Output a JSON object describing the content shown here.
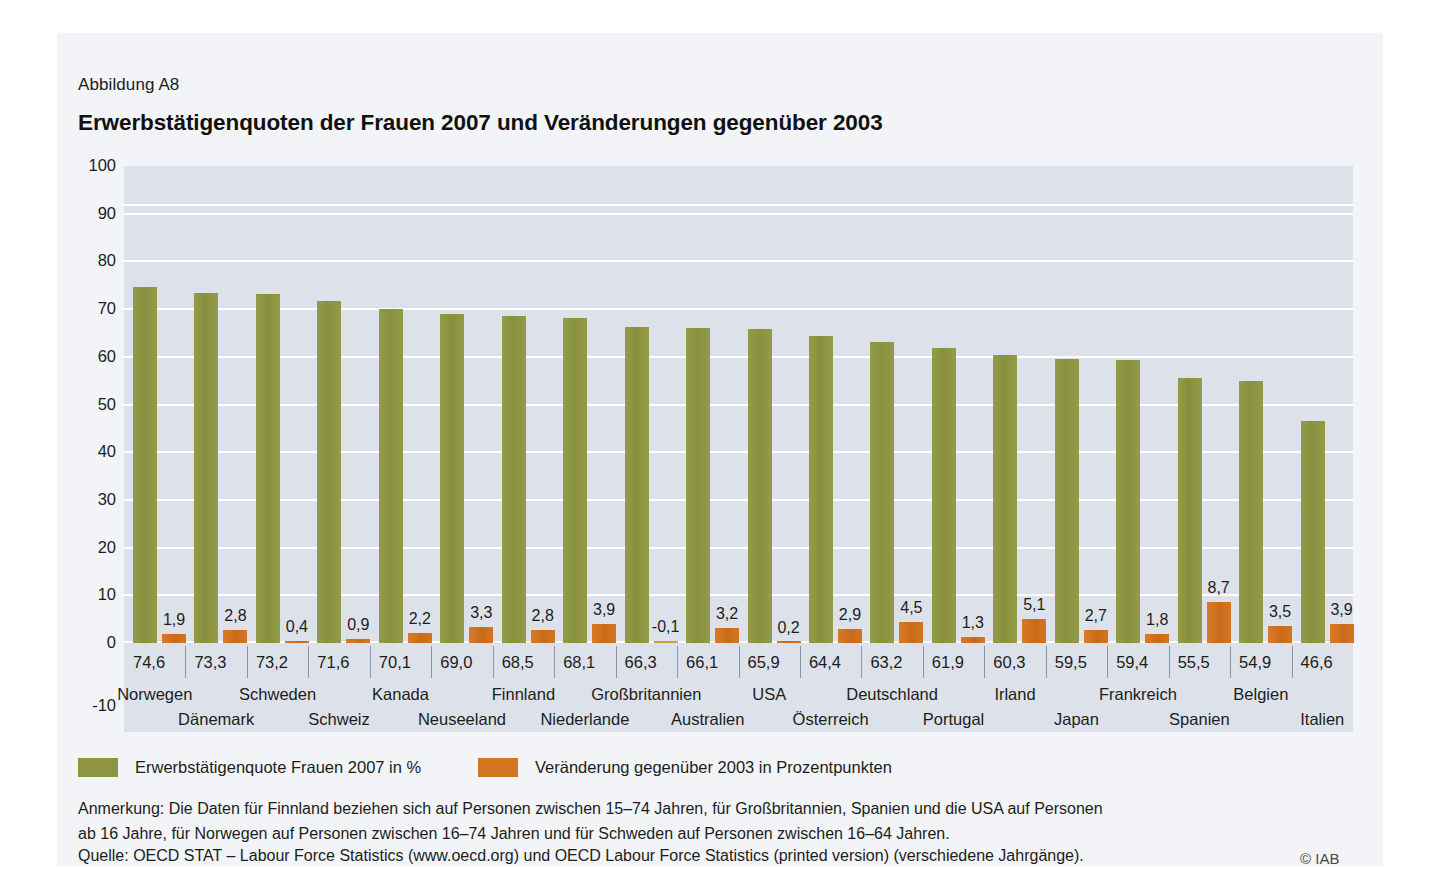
{
  "figure": {
    "number": "Abbildung A8",
    "title": "Erwerbstätigenquoten der Frauen 2007 und Veränderungen gegenüber 2003"
  },
  "legend": {
    "items": [
      {
        "label": "Erwerbstätigenquote Frauen 2007 in %",
        "color": "#8d9541",
        "swatch": "green-swatch"
      },
      {
        "label": "Veränderung gegenüber 2003 in Prozentpunkten",
        "color": "#d4761f",
        "swatch": "orange-swatch"
      }
    ]
  },
  "notes": {
    "line1": "Anmerkung: Die Daten für Finnland beziehen sich auf Personen zwischen 15–74 Jahren, für Großbritannien, Spanien und die USA auf Personen",
    "line2": "ab 16 Jahre, für Norwegen auf Personen zwischen 16–74 Jahren und für Schweden auf Personen zwischen 16–64 Jahren.",
    "source": "Quelle: OECD STAT – Labour Force Statistics (www.oecd.org) und OECD Labour Force Statistics (printed version) (verschiedene Jahrgänge).",
    "copyright": "© IAB"
  },
  "chart_data": {
    "type": "bar",
    "title": "Erwerbstätigenquoten der Frauen 2007 und Veränderungen gegenüber 2003",
    "xlabel": "",
    "ylabel": "",
    "ylim": [
      -10,
      100
    ],
    "yticks": [
      "100",
      "90",
      "80",
      "70",
      "60",
      "50",
      "40",
      "30",
      "20",
      "10",
      "0",
      "-10"
    ],
    "ytick_values": [
      100,
      90,
      80,
      70,
      60,
      50,
      40,
      30,
      20,
      10,
      0,
      -10
    ],
    "grid": true,
    "legend_position": "bottom-left",
    "categories": [
      "Norwegen",
      "Dänemark",
      "Schweden",
      "Schweiz",
      "Kanada",
      "Neuseeland",
      "Finnland",
      "Niederlande",
      "Großbritannien",
      "Australien",
      "USA",
      "Österreich",
      "Deutschland",
      "Portugal",
      "Irland",
      "Japan",
      "Frankreich",
      "Spanien",
      "Belgien",
      "Italien"
    ],
    "series": [
      {
        "name": "Erwerbstätigenquote Frauen 2007 in %",
        "color": "#8d9541",
        "values": [
          74.6,
          73.3,
          73.2,
          71.6,
          70.1,
          69.0,
          68.5,
          68.1,
          66.3,
          66.1,
          65.9,
          64.4,
          63.2,
          61.9,
          60.3,
          59.5,
          59.4,
          55.5,
          54.9,
          46.6
        ],
        "value_labels": [
          "74,6",
          "73,3",
          "73,2",
          "71,6",
          "70,1",
          "69,0",
          "68,5",
          "68,1",
          "66,3",
          "66,1",
          "65,9",
          "64,4",
          "63,2",
          "61,9",
          "60,3",
          "59,5",
          "59,4",
          "55,5",
          "54,9",
          "46,6"
        ]
      },
      {
        "name": "Veränderung gegenüber 2003 in Prozentpunkten",
        "color": "#d4761f",
        "values": [
          1.9,
          2.8,
          0.4,
          0.9,
          2.2,
          3.3,
          2.8,
          3.9,
          -0.1,
          3.2,
          0.2,
          2.9,
          4.5,
          1.3,
          5.1,
          2.7,
          1.8,
          8.7,
          3.5,
          3.9
        ],
        "value_labels": [
          "1,9",
          "2,8",
          "0,4",
          "0,9",
          "2,2",
          "3,3",
          "2,8",
          "3,9",
          "-0,1",
          "3,2",
          "0,2",
          "2,9",
          "4,5",
          "1,3",
          "5,1",
          "2,7",
          "1,8",
          "8,7",
          "3,5",
          "3,9"
        ]
      }
    ]
  }
}
